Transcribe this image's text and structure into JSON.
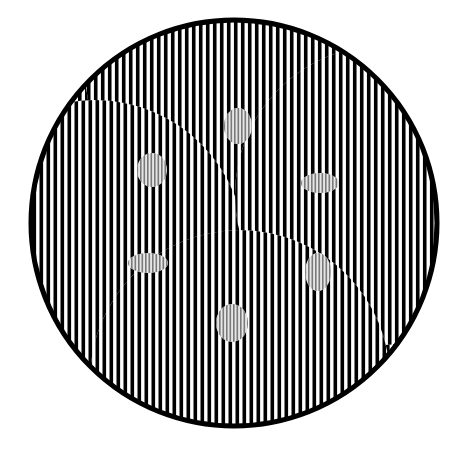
{
  "image": {
    "title": "Striped circle optical illusion",
    "background": "#ffffff",
    "stripe_color": "#000000",
    "fine_stripe_color": "#7a7a7a",
    "circle": {
      "cx": 234,
      "cy": 223,
      "r": 203,
      "stroke_width": 5
    },
    "stripe_period": 7,
    "stripe_width": 3.6,
    "swirls": [
      {
        "cx": 235,
        "cy": 70,
        "r": 150,
        "shift": 3.5
      },
      {
        "cx": 95,
        "cy": 250,
        "r": 150,
        "shift": 3.5
      },
      {
        "cx": 385,
        "cy": 195,
        "r": 150,
        "shift": 3.5
      },
      {
        "cx": 240,
        "cy": 380,
        "r": 150,
        "shift": 3.5
      }
    ],
    "blobs": [
      {
        "cx": 238,
        "cy": 126,
        "rx": 14,
        "ry": 18
      },
      {
        "cx": 152,
        "cy": 170,
        "rx": 15,
        "ry": 17
      },
      {
        "cx": 320,
        "cy": 183,
        "rx": 19,
        "ry": 10
      },
      {
        "cx": 148,
        "cy": 263,
        "rx": 20,
        "ry": 10
      },
      {
        "cx": 318,
        "cy": 272,
        "rx": 13,
        "ry": 19
      },
      {
        "cx": 232,
        "cy": 323,
        "rx": 16,
        "ry": 19
      }
    ]
  }
}
